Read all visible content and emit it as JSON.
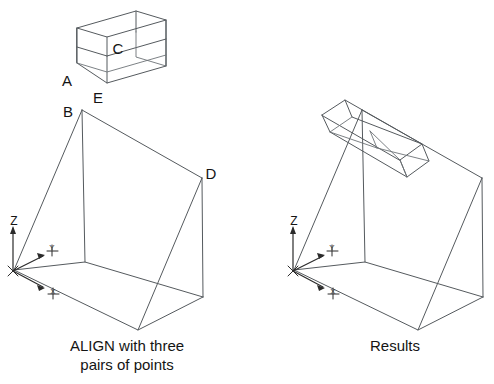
{
  "figure": {
    "title": "ALIGN with three pairs of points",
    "background_color": "#ffffff",
    "line_color": "#555a5e",
    "text_color": "#141414",
    "width": 494,
    "height": 384
  },
  "captions": {
    "left": "ALIGN with three\npairs of points",
    "right": "Results"
  },
  "left_panel": {
    "name": "before-align",
    "source_box": {
      "label_c": "C",
      "label_a": "A",
      "label_e": "E",
      "front_face": "107,18 166,36 166,66 107,48",
      "top_face": "77,28 136,11 166,19 107,36",
      "left_face": "77,28 107,36 107,83 77,63",
      "bottom_edge": "107,83 166,66",
      "inner_vert_1": "136,11 136,57",
      "inner_vert_2": "107,36 107,83",
      "inner_top_right": "136,57 166,66",
      "inner_left_diag": "77,63 107,83",
      "hidden_back_top": "136,11 166,19",
      "mid_horizontal": "77,47 107,56",
      "mid_horizontal_2": "107,56 166,36",
      "right_vert": "166,19 166,66",
      "back_left_vert": "77,28 77,63"
    },
    "target_wedge": {
      "label_b": "B",
      "label_d": "D",
      "apex_top": "82,110",
      "slant_top_right": "202,178",
      "vertical_front": "85,262",
      "bottom_front": "138,330",
      "bottom_right": "203,297",
      "origin": "13,271"
    },
    "ucs": {
      "label_z": "Z",
      "label_y": "Y",
      "label_x": "X",
      "origin_x": 13,
      "origin_y": 271
    }
  },
  "right_panel": {
    "name": "after-align",
    "aligned_box": {
      "face_a": "322,115 344,101 372,110 350,126",
      "face_b": "350,126 372,110 422,150 400,164",
      "note": "box rotated onto slanted face"
    },
    "target_wedge": {
      "apex_top": "362,110",
      "slant_top_right": "482,178",
      "vertical_front": "365,262",
      "bottom_front": "418,330",
      "bottom_right": "483,297",
      "origin": "293,271"
    },
    "ucs": {
      "label_z": "Z",
      "label_y": "Y",
      "label_x": "X",
      "origin_x": 293,
      "origin_y": 271
    }
  }
}
